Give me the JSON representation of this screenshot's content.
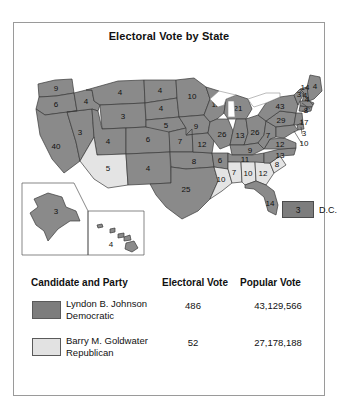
{
  "figure": {
    "title": "Electoral Vote by State"
  },
  "map": {
    "dc": {
      "value": "3",
      "label": "D.C."
    },
    "states": [
      {
        "code": "WA",
        "value": "9",
        "party": "dem"
      },
      {
        "code": "OR",
        "value": "6",
        "party": "dem"
      },
      {
        "code": "CA",
        "value": "40",
        "party": "dem"
      },
      {
        "code": "NV",
        "value": "3",
        "party": "dem"
      },
      {
        "code": "ID",
        "value": "4",
        "party": "dem"
      },
      {
        "code": "MT",
        "value": "4",
        "party": "dem"
      },
      {
        "code": "WY",
        "value": "3",
        "party": "dem"
      },
      {
        "code": "UT",
        "value": "4",
        "party": "dem"
      },
      {
        "code": "AZ",
        "value": "5",
        "party": "rep"
      },
      {
        "code": "CO",
        "value": "6",
        "party": "dem"
      },
      {
        "code": "NM",
        "value": "4",
        "party": "dem"
      },
      {
        "code": "ND",
        "value": "4",
        "party": "dem"
      },
      {
        "code": "SD",
        "value": "4",
        "party": "dem"
      },
      {
        "code": "NE",
        "value": "5",
        "party": "dem"
      },
      {
        "code": "KS",
        "value": "7",
        "party": "dem"
      },
      {
        "code": "OK",
        "value": "8",
        "party": "dem"
      },
      {
        "code": "TX",
        "value": "25",
        "party": "dem"
      },
      {
        "code": "MN",
        "value": "10",
        "party": "dem"
      },
      {
        "code": "IA",
        "value": "9",
        "party": "dem"
      },
      {
        "code": "MO",
        "value": "12",
        "party": "dem"
      },
      {
        "code": "AR",
        "value": "6",
        "party": "dem"
      },
      {
        "code": "LA",
        "value": "10",
        "party": "rep"
      },
      {
        "code": "WI",
        "value": "12",
        "party": "dem"
      },
      {
        "code": "IL",
        "value": "26",
        "party": "dem"
      },
      {
        "code": "MI",
        "value": "21",
        "party": "dem"
      },
      {
        "code": "IN",
        "value": "13",
        "party": "dem"
      },
      {
        "code": "OH",
        "value": "26",
        "party": "dem"
      },
      {
        "code": "KY",
        "value": "9",
        "party": "dem"
      },
      {
        "code": "TN",
        "value": "11",
        "party": "dem"
      },
      {
        "code": "MS",
        "value": "7",
        "party": "rep"
      },
      {
        "code": "AL",
        "value": "10",
        "party": "rep"
      },
      {
        "code": "GA",
        "value": "12",
        "party": "rep"
      },
      {
        "code": "SC",
        "value": "8",
        "party": "rep"
      },
      {
        "code": "NC",
        "value": "13",
        "party": "dem"
      },
      {
        "code": "VA",
        "value": "12",
        "party": "dem"
      },
      {
        "code": "WV",
        "value": "7",
        "party": "dem"
      },
      {
        "code": "FL",
        "value": "14",
        "party": "dem"
      },
      {
        "code": "PA",
        "value": "29",
        "party": "dem"
      },
      {
        "code": "NY",
        "value": "43",
        "party": "dem"
      },
      {
        "code": "VT",
        "value": "3",
        "party": "dem"
      },
      {
        "code": "NH",
        "value": "4",
        "party": "dem"
      },
      {
        "code": "ME",
        "value": "4",
        "party": "dem"
      },
      {
        "code": "MA",
        "value": "14",
        "party": "dem"
      },
      {
        "code": "RI",
        "value": "4",
        "party": "dem"
      },
      {
        "code": "CT",
        "value": "8",
        "party": "dem"
      },
      {
        "code": "NJ",
        "value": "17",
        "party": "dem"
      },
      {
        "code": "DE",
        "value": "3",
        "party": "dem"
      },
      {
        "code": "MD",
        "value": "10",
        "party": "dem"
      },
      {
        "code": "AK",
        "value": "3",
        "party": "dem"
      },
      {
        "code": "HI",
        "value": "4",
        "party": "dem"
      }
    ]
  },
  "legend": {
    "headers": {
      "candidate": "Candidate and Party",
      "electoral": "Electoral Vote",
      "popular": "Popular Vote"
    },
    "rows": [
      {
        "candidate": "Lyndon B. Johnson\nDemocratic",
        "electoral": "486",
        "popular": "43,129,566",
        "color": "#7d7d7d"
      },
      {
        "candidate": "Barry M. Goldwater\nRepublican",
        "electoral": "52",
        "popular": "27,178,188",
        "color": "#e2e2e2"
      }
    ]
  },
  "colors": {
    "democratic": "#8a8a8a",
    "republican": "#e4e4e4",
    "outline": "#3a3a3a",
    "frame": "#9a9a9a"
  }
}
